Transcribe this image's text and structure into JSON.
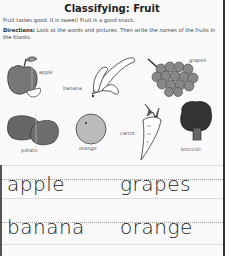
{
  "worksheet": {
    "title": "Classifying: Fruit",
    "intro": "Fruit tastes good. It is sweet! Fruit is a good snack.",
    "directions_label": "Directions:",
    "directions_text": " Look at the words and pictures. Then write the names of the fruits in the blanks."
  },
  "pictures": [
    {
      "label": "apple",
      "icon": "apple-icon"
    },
    {
      "label": "banana",
      "icon": "banana-icon"
    },
    {
      "label": "grapes",
      "icon": "grapes-icon"
    },
    {
      "label": "potato",
      "icon": "potato-icon"
    },
    {
      "label": "orange",
      "icon": "orange-icon"
    },
    {
      "label": "carrot",
      "icon": "carrot-icon"
    },
    {
      "label": "broccoli",
      "icon": "broccoli-icon"
    }
  ],
  "answers": [
    "apple",
    "grapes",
    "banana",
    "orange"
  ]
}
